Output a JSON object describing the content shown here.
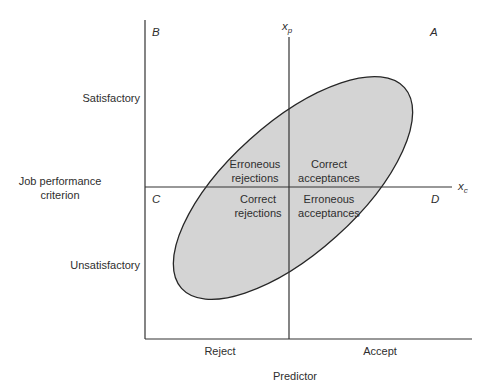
{
  "diagram": {
    "y_axis": {
      "title_line1": "Job performance",
      "title_line2": "criterion",
      "top_label": "Satisfactory",
      "bottom_label": "Unsatisfactory"
    },
    "x_axis": {
      "title": "Predictor",
      "left_label": "Reject",
      "right_label": "Accept"
    },
    "cutoffs": {
      "predictor_cutoff": "x",
      "predictor_cutoff_sub": "p",
      "criterion_cutoff": "x",
      "criterion_cutoff_sub": "c"
    },
    "quadrant_letters": {
      "top_left": "B",
      "top_right": "A",
      "bottom_left": "C",
      "bottom_right": "D"
    },
    "regions": {
      "top_left_line1": "Erroneous",
      "top_left_line2": "rejections",
      "top_right_line1": "Correct",
      "top_right_line2": "acceptances",
      "bottom_left_line1": "Correct",
      "bottom_left_line2": "rejections",
      "bottom_right_line1": "Erroneous",
      "bottom_right_line2": "acceptances"
    },
    "colors": {
      "ellipse_fill": "#d4d4d4",
      "line": "#2a2a2a"
    }
  }
}
